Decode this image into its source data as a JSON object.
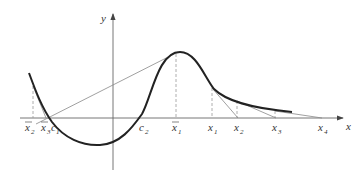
{
  "figure": {
    "axes": {
      "x_label": "x",
      "y_label": "y"
    },
    "points": [
      {
        "id": "xbar2",
        "base": "x",
        "sub": "2",
        "bar": true
      },
      {
        "id": "xbar3",
        "base": "x",
        "sub": "3",
        "bar": true
      },
      {
        "id": "c1",
        "base": "c",
        "sub": "1",
        "bar": false
      },
      {
        "id": "c2",
        "base": "c",
        "sub": "2",
        "bar": false
      },
      {
        "id": "xbar1",
        "base": "x",
        "sub": "1",
        "bar": true
      },
      {
        "id": "x1",
        "base": "x",
        "sub": "1",
        "bar": false
      },
      {
        "id": "x2",
        "base": "x",
        "sub": "2",
        "bar": false
      },
      {
        "id": "x3",
        "base": "x",
        "sub": "3",
        "bar": false
      },
      {
        "id": "x4",
        "base": "x",
        "sub": "4",
        "bar": false
      }
    ]
  }
}
